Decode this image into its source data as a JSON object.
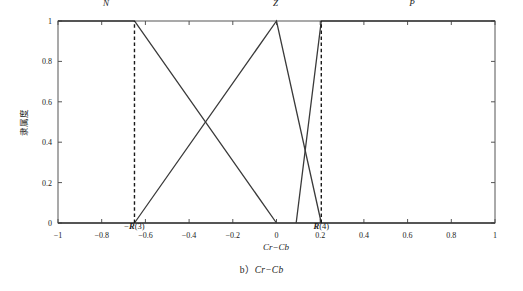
{
  "figure": {
    "caption_prefix": "b）",
    "caption_italic": "Cr−Cb"
  },
  "chart_data": {
    "type": "line",
    "title": "",
    "xlabel": "Cr−Cb",
    "ylabel": "隶属度",
    "xlim": [
      -1,
      1
    ],
    "ylim": [
      0,
      1
    ],
    "grid": false,
    "legend": "none",
    "x_ticks": [
      -1,
      -0.8,
      -0.6,
      -0.4,
      -0.2,
      0,
      0.2,
      0.4,
      0.6,
      0.8,
      1
    ],
    "x_tick_labels": [
      "−1",
      "−0.8",
      "−0.6",
      "−0.4",
      "−0.2",
      "0",
      "0.2",
      "0.4",
      "0.6",
      "0.8",
      "1"
    ],
    "y_ticks": [
      0,
      0.2,
      0.4,
      0.6,
      0.8,
      1
    ],
    "y_tick_labels": [
      "0",
      "0.2",
      "0.4",
      "0.6",
      "0.8",
      "1"
    ],
    "series": [
      {
        "name": "N",
        "label": "N",
        "label_x": -0.78,
        "label_y": 1.09,
        "points": [
          [
            -1,
            1
          ],
          [
            -0.65,
            1
          ],
          [
            0,
            0
          ]
        ]
      },
      {
        "name": "Z",
        "label": "Z",
        "label_x": -0.005,
        "label_y": 1.09,
        "points": [
          [
            -0.65,
            0
          ],
          [
            0,
            1
          ],
          [
            0.205,
            0
          ]
        ]
      },
      {
        "name": "P",
        "label": "P",
        "label_x": 0.62,
        "label_y": 1.09,
        "points": [
          [
            0.09,
            0
          ],
          [
            0.205,
            1
          ],
          [
            1,
            1
          ]
        ]
      },
      {
        "name": "baseline",
        "label": "",
        "points": [
          [
            -1,
            0
          ],
          [
            1,
            0
          ]
        ]
      }
    ],
    "annotations": [
      {
        "name": "neg-R3",
        "x": -0.65,
        "text_prefix": "−",
        "text_bold_italic": "R",
        "text_suffix": "(3)",
        "dashed_from_y": 0,
        "dashed_to_y": 1
      },
      {
        "name": "R4",
        "x": 0.205,
        "text_prefix": "",
        "text_bold_italic": "R",
        "text_suffix": "(4)",
        "dashed_from_y": 0,
        "dashed_to_y": 1
      }
    ],
    "colors": {
      "line": "#3a3a3a",
      "axis": "#555555",
      "dashed": "#1a1a1a",
      "background": "#ffffff"
    }
  }
}
